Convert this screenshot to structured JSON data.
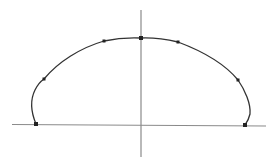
{
  "diagram": {
    "width": 278,
    "height": 168,
    "colors": {
      "background": "#ffffff",
      "axis": "#8a8a8a",
      "curve": "#333333",
      "point": "#222222"
    },
    "x_axis": {
      "x1": 12,
      "y1": 124.5,
      "x2": 266,
      "y2": 126
    },
    "y_axis": {
      "x1": 141,
      "y1": 10,
      "x2": 141,
      "y2": 157
    },
    "curve_path": "M36,124 C31,112 30,100 35,90 C38,84 41,81 44,79 C58,62 80,48 104,41 C118,38 130,37.5 141,38 C153,37.5 165,39 178,42 C202,51 224,63 238,80 C245,90 251,104 250,114 C249,119 247,122 245,125",
    "points": [
      {
        "name": "left-base-point",
        "x": 36,
        "y": 124,
        "size": 4
      },
      {
        "name": "left-mid-point",
        "x": 44,
        "y": 79,
        "size": 3
      },
      {
        "name": "left-upper-point",
        "x": 104,
        "y": 41,
        "size": 3
      },
      {
        "name": "apex-point",
        "x": 141,
        "y": 38,
        "size": 4
      },
      {
        "name": "right-upper-point",
        "x": 178,
        "y": 42,
        "size": 3
      },
      {
        "name": "right-mid-point",
        "x": 238,
        "y": 80,
        "size": 3
      },
      {
        "name": "right-base-point",
        "x": 245,
        "y": 125,
        "size": 4
      }
    ]
  }
}
